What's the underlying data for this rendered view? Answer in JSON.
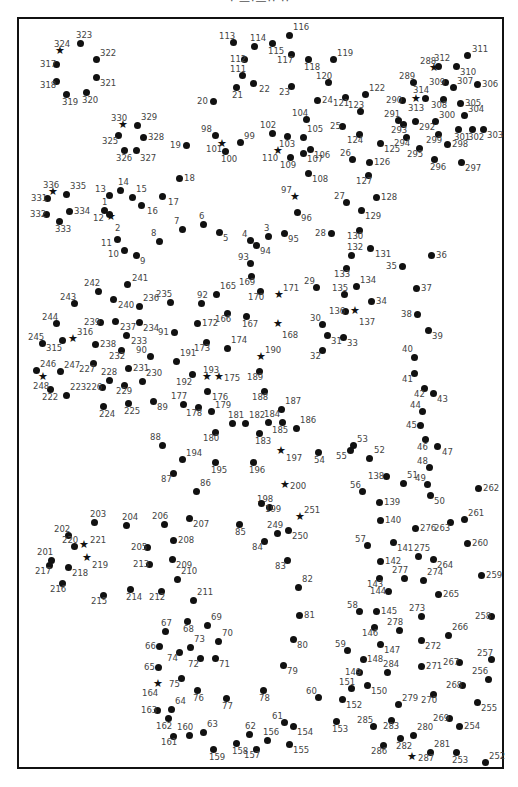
{
  "header": {
    "title": "· —·—·· ··"
  },
  "puzzle": {
    "type": "dot-to-dot",
    "point_count": 336,
    "star_points": [
      2,
      97,
      101,
      110,
      137,
      164,
      168,
      171,
      175,
      190,
      193,
      197,
      200,
      219,
      221,
      248,
      251,
      287,
      288,
      313,
      316,
      324,
      330,
      336
    ],
    "points": [
      1,
      2,
      3,
      4,
      5,
      6,
      7,
      8,
      9,
      10,
      11,
      12,
      13,
      14,
      15,
      16,
      17,
      18,
      19,
      20,
      21,
      22,
      23,
      24,
      25,
      26,
      27,
      28,
      29,
      30,
      31,
      32,
      33,
      34,
      35,
      36,
      37,
      38,
      39,
      40,
      41,
      42,
      43,
      44,
      45,
      46,
      47,
      48,
      49,
      50,
      51,
      52,
      53,
      54,
      55,
      56,
      57,
      58,
      59,
      60,
      61,
      62,
      63,
      64,
      65,
      66,
      67,
      68,
      69,
      70,
      71,
      72,
      73,
      74,
      75,
      76,
      77,
      78,
      79,
      80,
      81,
      82,
      83,
      84,
      85,
      86,
      87,
      88,
      89,
      90,
      91,
      92,
      93,
      94,
      95,
      96,
      97,
      98,
      99,
      100,
      101,
      102,
      103,
      104,
      105,
      106,
      107,
      108,
      109,
      110,
      111,
      112,
      113,
      114,
      115,
      116,
      117,
      118,
      119,
      120,
      121,
      122,
      123,
      124,
      125,
      126,
      127,
      128,
      129,
      130,
      131,
      132,
      133,
      134,
      135,
      136,
      137,
      138,
      139,
      140,
      141,
      142,
      143,
      144,
      145,
      146,
      147,
      148,
      149,
      150,
      151,
      152,
      153,
      154,
      155,
      156,
      157,
      158,
      159,
      160,
      161,
      162,
      163,
      164,
      165,
      166,
      167,
      168,
      169,
      170,
      171,
      172,
      173,
      174,
      175,
      176,
      177,
      178,
      179,
      180,
      181,
      182,
      183,
      184,
      185,
      186,
      187,
      188,
      189,
      190,
      191,
      192,
      193,
      194,
      195,
      196,
      197,
      198,
      199,
      200,
      201,
      202,
      203,
      204,
      205,
      206,
      207,
      208,
      209,
      210,
      211,
      212,
      213,
      214,
      215,
      216,
      217,
      218,
      219,
      220,
      221,
      222,
      223,
      224,
      225,
      226,
      227,
      228,
      229,
      230,
      231,
      232,
      233,
      234,
      235,
      236,
      237,
      238,
      239,
      240,
      241,
      242,
      243,
      244,
      245,
      246,
      247,
      248,
      249,
      250,
      251,
      252,
      253,
      254,
      255,
      256,
      257,
      258,
      259,
      260,
      261,
      262,
      263,
      264,
      265,
      266,
      267,
      268,
      269,
      270,
      271,
      272,
      273,
      274,
      275,
      276,
      277,
      278,
      279,
      280,
      281,
      282,
      283,
      284,
      285,
      286,
      287,
      288,
      289,
      290,
      291,
      292,
      293,
      294,
      295,
      296,
      297,
      298,
      299,
      300,
      301,
      302,
      303,
      304,
      305,
      306,
      307,
      308,
      309,
      310,
      311,
      312,
      313,
      314,
      315,
      316,
      317,
      318,
      319,
      320,
      321,
      322,
      323,
      324,
      325,
      326,
      327,
      328,
      329,
      330,
      331,
      332,
      333,
      334,
      335,
      336
    ]
  }
}
